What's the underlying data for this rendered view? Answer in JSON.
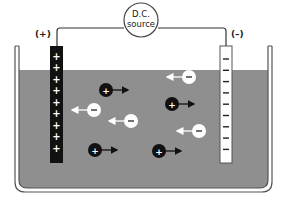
{
  "diagram": {
    "source": {
      "line1": "D.C.",
      "line2": "source"
    },
    "anode": {
      "polarity_label": "(+)",
      "sign": "+",
      "sign_count": 9,
      "color": "#111111",
      "sign_color": "#ffffff"
    },
    "cathode": {
      "polarity_label": "(–)",
      "sign": "–",
      "sign_count": 9,
      "color": "#ffffff",
      "sign_color": "#222222"
    },
    "electrolyte_color": "#8f8f8f",
    "cations": {
      "sign": "+",
      "fill": "#111111",
      "direction": "right",
      "items": [
        {
          "x": 106,
          "y": 90
        },
        {
          "x": 172,
          "y": 104
        },
        {
          "x": 95,
          "y": 150
        },
        {
          "x": 159,
          "y": 151
        }
      ]
    },
    "anions": {
      "sign": "–",
      "fill": "#ffffff",
      "direction": "left",
      "items": [
        {
          "x": 189,
          "y": 77
        },
        {
          "x": 94,
          "y": 110
        },
        {
          "x": 131,
          "y": 121
        },
        {
          "x": 199,
          "y": 131
        }
      ]
    }
  }
}
